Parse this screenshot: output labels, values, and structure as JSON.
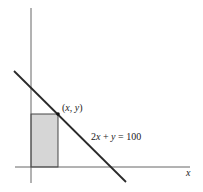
{
  "figure": {
    "type": "coordinate-diagram",
    "axes": {
      "x_label": "x",
      "y_label": ""
    },
    "line": {
      "equation": "2x + y = 100",
      "equation_parts": {
        "lhs_coef": "2",
        "lhs_var": "x",
        "plus": " + ",
        "y_var": "y",
        "equals": " = ",
        "rhs": "100"
      }
    },
    "point": {
      "label": "(x, y)",
      "label_parts": {
        "open": "(",
        "x": "x",
        "sep": ", ",
        "y": "y",
        "close": ")"
      }
    },
    "rectangle": {
      "description": "shaded rectangle with corner at origin and opposite corner at (x, y)",
      "fill_color": "#d6d6d6",
      "stroke_color": "#333333"
    },
    "colors": {
      "axis": "#555555",
      "line": "#2a2a2a",
      "point": "#111111"
    }
  }
}
